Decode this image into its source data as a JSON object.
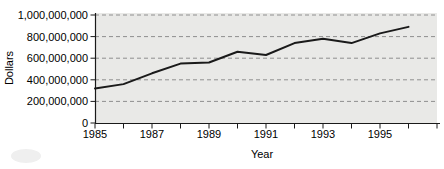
{
  "chart_data": {
    "type": "line",
    "title": "",
    "xlabel": "Year",
    "ylabel": "Dollars",
    "x": [
      1985,
      1986,
      1987,
      1988,
      1989,
      1990,
      1991,
      1992,
      1993,
      1994,
      1995,
      1996
    ],
    "values": [
      320000000,
      360000000,
      460000000,
      550000000,
      560000000,
      660000000,
      630000000,
      740000000,
      780000000,
      740000000,
      830000000,
      890000000
    ],
    "ylim": [
      0,
      1000000000
    ],
    "ytick_interval": 200000000,
    "ytick_labels": [
      "0",
      "200,000,000",
      "400,000,000",
      "600,000,000",
      "800,000,000",
      "1,000,000,000"
    ],
    "xtick_labels": [
      "1985",
      "1987",
      "1989",
      "1991",
      "1993",
      "1995"
    ],
    "x_axis_boundary_tick_count": 13,
    "grid": "horizontal-dashed",
    "legend": "none",
    "line_color": "#1a1a1a",
    "plot_bg_color": "#e9e9e7",
    "grid_color": "#8f8f8f",
    "text_color": "#000000"
  }
}
